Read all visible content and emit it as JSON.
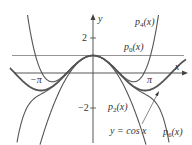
{
  "chart_data": {
    "type": "line",
    "title": "",
    "xlabel": "x",
    "ylabel": "y",
    "x_ticks": [
      "-π",
      "π"
    ],
    "y_ticks": [
      "2",
      "-2"
    ],
    "xlim": [
      -5.6,
      6.0
    ],
    "ylim": [
      -4.1,
      4.0
    ],
    "grid": false,
    "series": [
      {
        "name": "p0(x)",
        "coeffs": [
          1
        ],
        "label_pos": [
          0.0,
          0.0
        ]
      },
      {
        "name": "p2(x)",
        "coeffs": [
          1,
          0,
          -0.5
        ]
      },
      {
        "name": "p4(x)",
        "coeffs": [
          1,
          0,
          -0.5,
          0,
          0.041667
        ]
      },
      {
        "name": "p6(x)",
        "coeffs": [
          1,
          0,
          -0.5,
          0,
          0.041667,
          0,
          -0.0013889
        ]
      },
      {
        "name": "y = cos x",
        "function": "cos"
      }
    ]
  },
  "labels": {
    "y_axis": "y",
    "x_axis": "x",
    "tick_2": "2",
    "tick_neg2": "−2",
    "neg_pi": "−π",
    "pi": "π",
    "p4": "p",
    "p4_sub": "4",
    "p0": "p",
    "p0_sub": "0",
    "p2": "p",
    "p2_sub": "2",
    "p6": "p",
    "p6_sub": "6",
    "arg": "(x)",
    "cos_label": "y = cos x"
  },
  "colors": {
    "curve": "#555555",
    "axis": "#444444",
    "p0_line": "#888888",
    "text": "#333333"
  }
}
